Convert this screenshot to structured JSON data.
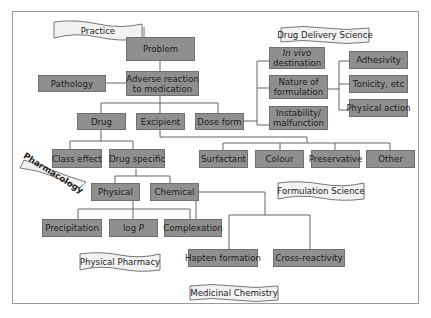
{
  "diagram": {
    "type": "hierarchy-tree",
    "box_color": "#8f8f8f",
    "line_color": "#555555",
    "nodes": {
      "problem": "Problem",
      "adverse": "Adverse reaction to medication",
      "adverse_l1": "Adverse reaction",
      "adverse_l2": "to medication",
      "pathology": "Pathology",
      "drug": "Drug",
      "excipient": "Excipient",
      "dose_form": "Dose form",
      "invivo_l1": "In vivo",
      "invivo_l2": "destination",
      "nature_l1": "Nature of",
      "nature_l2": "formulation",
      "instab_l1": "Instability/",
      "instab_l2": "malfunction",
      "adhesivity": "Adhesivity",
      "tonicity": "Tonicity, etc",
      "physical_action": "Physical action",
      "class_effect": "Class effect",
      "drug_specific": "Drug specific",
      "surfactant": "Surfactant",
      "colour": "Colour",
      "preservative": "Preservative",
      "other": "Other",
      "physical": "Physical",
      "chemical": "Chemical",
      "precipitation": "Precipitation",
      "logp_prefix": "log ",
      "logp_var": "P",
      "complexation": "Complexation",
      "hapten": "Hapten formation",
      "cross": "Cross-reactivity"
    },
    "banners": {
      "practice": "Practice",
      "drug_delivery": "Drug Delivery Science",
      "pharmacology": "Pharmacology",
      "formulation": "Formulation Science",
      "physical_pharmacy": "Physical Pharmacy",
      "medicinal_chemistry": "Medicinal Chemistry"
    }
  }
}
